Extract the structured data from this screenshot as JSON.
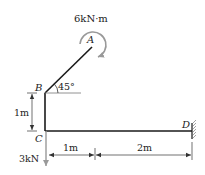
{
  "diagram": {
    "type": "structural-frame",
    "points": {
      "A": {
        "label": "A"
      },
      "B": {
        "label": "B"
      },
      "C": {
        "label": "C"
      },
      "D": {
        "label": "D"
      }
    },
    "loads": {
      "moment": {
        "label": "6kN·m",
        "at": "A",
        "direction": "clockwise"
      },
      "force": {
        "label": "3kN",
        "at": "C",
        "direction": "down"
      }
    },
    "angle": {
      "label": "45°",
      "at": "B"
    },
    "dimensions": {
      "vertical_BC": "1m",
      "horizontal_1": "1m",
      "horizontal_2": "2m"
    },
    "support": {
      "at": "D",
      "type": "fixed-wall"
    },
    "colors": {
      "member": "#1a1a1a",
      "load": "#888888",
      "dimension": "#333333"
    }
  }
}
